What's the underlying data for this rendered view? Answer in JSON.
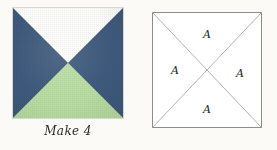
{
  "page": {
    "background_color": "#fbfaf6",
    "width": 277,
    "height": 150
  },
  "block_photo": {
    "name": "quilt-block-photo",
    "caption": "Make 4",
    "border_color": "#d8d6cf",
    "patches": [
      {
        "position": "top",
        "fabric": "background white",
        "color": "#fdfdfb"
      },
      {
        "position": "left",
        "fabric": "navy blue",
        "color": "#3f5a7d"
      },
      {
        "position": "right",
        "fabric": "navy blue",
        "color": "#3f5a7d"
      },
      {
        "position": "bottom",
        "fabric": "light green",
        "color": "#b9dda3"
      }
    ]
  },
  "block_diagram": {
    "name": "quilt-block-line-diagram",
    "outline_color": "#8d8d8d",
    "seam_color": "#b0b0b0",
    "labels": [
      {
        "position": "top",
        "text": "A",
        "x": 55,
        "y": 24
      },
      {
        "position": "left",
        "text": "A",
        "x": 22,
        "y": 60
      },
      {
        "position": "right",
        "text": "A",
        "x": 88,
        "y": 62
      },
      {
        "position": "bottom",
        "text": "A",
        "x": 55,
        "y": 99
      }
    ]
  }
}
